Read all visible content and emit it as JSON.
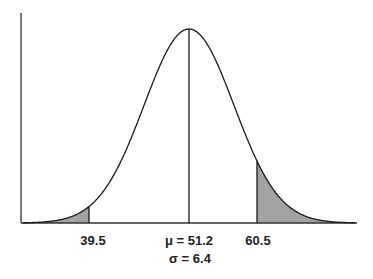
{
  "chart_data": {
    "type": "area",
    "title": "",
    "distribution": "normal",
    "mean": 51.2,
    "std_dev": 6.4,
    "markers": [
      39.5,
      51.2,
      60.5
    ],
    "shaded_regions": [
      {
        "from": "-inf",
        "to": 39.5,
        "label": "left tail"
      },
      {
        "from": 60.5,
        "to": "+inf",
        "label": "right tail"
      }
    ],
    "xlabel": "",
    "ylabel": "",
    "grid": false,
    "legend": null
  },
  "labels": {
    "left_cut": "39.5",
    "mean": "μ = 51.2",
    "sigma": "σ = 6.4",
    "right_cut": "60.5"
  },
  "colors": {
    "curve": "#1a1a1a",
    "shade": "#a3a3a3",
    "axis": "#333333",
    "background": "#ffffff"
  },
  "layout_px": {
    "axis_x": 21,
    "axis_top": 13,
    "baseline": 223,
    "axis_right": 357,
    "peak_x": 189,
    "peak_y": 29,
    "sigma_px": 45,
    "left_cut_x": 89,
    "right_cut_x": 257
  }
}
